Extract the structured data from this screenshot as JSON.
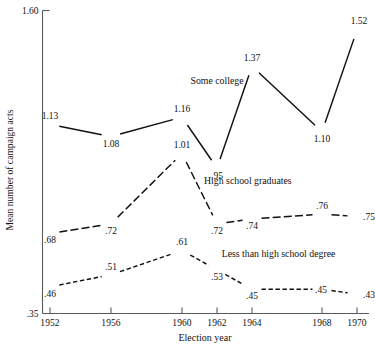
{
  "chart_data": {
    "type": "line",
    "title": "",
    "xlabel": "Election year",
    "ylabel": "Mean number of campaign acts",
    "x": [
      1952,
      1956,
      1960,
      1962,
      1964,
      1968,
      1970
    ],
    "categories": [
      "1952",
      "1956",
      "1960",
      "1962",
      "1964",
      "1968",
      "1970"
    ],
    "xlim": [
      1951,
      1971
    ],
    "ylim": [
      0.35,
      1.6
    ],
    "ytick_labels": [
      "1.60",
      ".35"
    ],
    "ytick_values": [
      1.6,
      0.35
    ],
    "grid": false,
    "legend": "inline-annotations",
    "series": [
      {
        "name": "Some college",
        "label": "Some college",
        "line_style": "solid",
        "values": [
          1.13,
          1.08,
          1.16,
          0.95,
          1.37,
          1.1,
          1.52
        ],
        "value_labels": [
          "1.13",
          "1.08",
          "1.16",
          ".95",
          "1.37",
          "1.10",
          "1.52"
        ],
        "label_x": 1962.0,
        "label_y": 1.295
      },
      {
        "name": "High school graduates",
        "label": "High school graduates",
        "line_style": "longdash",
        "values": [
          0.68,
          0.72,
          1.01,
          0.72,
          0.74,
          0.76,
          0.75
        ],
        "value_labels": [
          ".68",
          ".72",
          "1.01",
          ".72",
          ".74",
          ".76",
          ".75"
        ],
        "label_x": 1963.6,
        "label_y": 0.885
      },
      {
        "name": "Less than high school degree",
        "label": "Less than high school degree",
        "line_style": "shortdash",
        "values": [
          0.46,
          0.51,
          0.61,
          0.53,
          0.45,
          0.45,
          0.43
        ],
        "value_labels": [
          ".46",
          ".51",
          ".61",
          ".53",
          ".45",
          ".45",
          ".43"
        ],
        "label_x": 1965.4,
        "label_y": 0.585
      }
    ],
    "colors": {
      "line": "#111111",
      "axis": "#5a5a5a",
      "text": "#111111",
      "background": "#ffffff"
    }
  }
}
